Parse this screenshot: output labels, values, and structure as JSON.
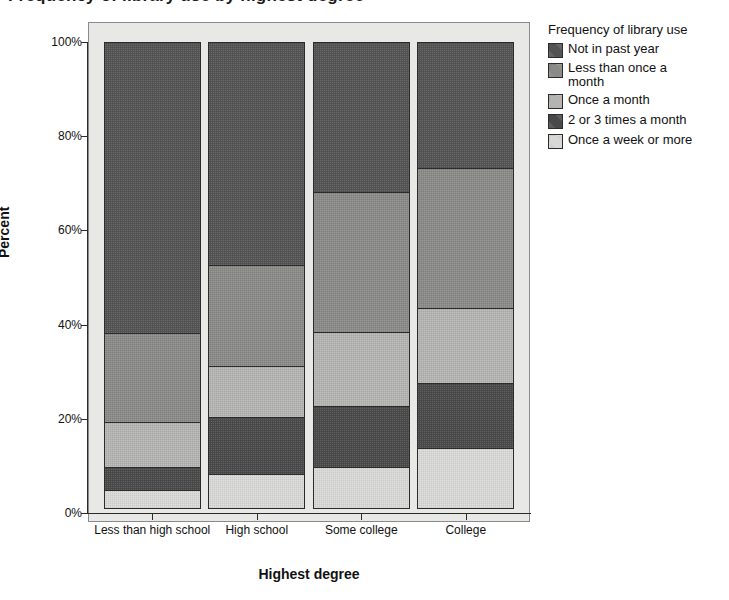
{
  "chart_data": {
    "type": "bar",
    "subtype": "stacked-100-percent",
    "title": "Frequency of library use by highest degree",
    "xlabel": "Highest degree",
    "ylabel": "Percent",
    "ylim": [
      0,
      100
    ],
    "yticks": [
      "0%",
      "20%",
      "40%",
      "60%",
      "80%",
      "100%"
    ],
    "ytick_values": [
      0,
      20,
      40,
      60,
      80,
      100
    ],
    "grid": false,
    "legend_title": "Frequency of library use",
    "legend_position": "right",
    "categories": [
      "Less than high school",
      "High school",
      "Some college",
      "College"
    ],
    "series": [
      {
        "name": "Once a week or more",
        "color": "#d8d8d6",
        "values": [
          4.0,
          7.5,
          9.0,
          13.0
        ]
      },
      {
        "name": "2 or 3 times a month",
        "color": "#4a4a4a",
        "values": [
          5.1,
          12.3,
          13.0,
          14.0
        ]
      },
      {
        "name": "Once a month",
        "color": "#b4b4b2",
        "values": [
          9.7,
          11.0,
          16.0,
          16.0
        ]
      },
      {
        "name": "Less than once a month",
        "color": "#8a8a88",
        "values": [
          19.2,
          21.7,
          30.0,
          30.0
        ]
      },
      {
        "name": "Not in past year",
        "color": "#545454",
        "values": [
          62.0,
          47.5,
          32.0,
          27.0
        ]
      }
    ],
    "cumulative_boundaries_percent": {
      "Less than high school": [
        4.0,
        9.1,
        18.8,
        38.0,
        100
      ],
      "High school": [
        7.5,
        19.8,
        30.8,
        52.5,
        100
      ],
      "Some college": [
        9.0,
        22.0,
        38.0,
        68.0,
        100
      ],
      "College": [
        13.0,
        27.0,
        43.0,
        73.0,
        100
      ]
    }
  },
  "legend": {
    "title": "Frequency of library use",
    "items": [
      {
        "label": "Not in past year",
        "color": "#545454"
      },
      {
        "label": "Less than once a\nmonth",
        "color": "#8a8a88"
      },
      {
        "label": "Once a month",
        "color": "#b4b4b2"
      },
      {
        "label": "2 or 3 times a month",
        "color": "#4a4a4a"
      },
      {
        "label": "Once a week or more",
        "color": "#d8d8d6"
      }
    ]
  },
  "colors": {
    "plot_background": "#e8e8e6",
    "axis": "#2b2b2b",
    "page_background": "#ffffff"
  }
}
